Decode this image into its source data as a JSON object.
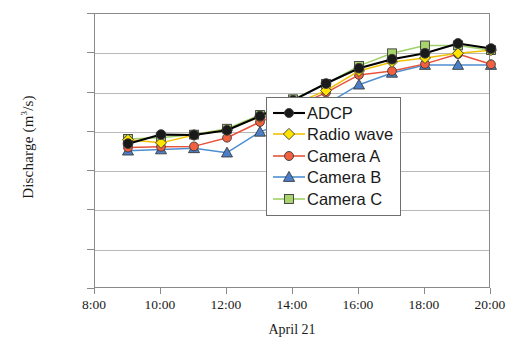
{
  "chart_data": {
    "type": "line",
    "title": "",
    "xlabel": "April 21",
    "ylabel": "Discharge (m3/s)",
    "ylabel_prefix": "Discharge (m",
    "ylabel_exponent": "3",
    "ylabel_suffix": "/s)",
    "ylim": [
      0,
      700
    ],
    "ytick_step": 100,
    "yticks": [
      "0",
      "100",
      "200",
      "300",
      "400",
      "500",
      "600",
      "700"
    ],
    "ytick_values": [
      0,
      100,
      200,
      300,
      400,
      500,
      600,
      700
    ],
    "xlim_hours": [
      8,
      20
    ],
    "xticks": [
      "8:00",
      "10:00",
      "12:00",
      "14:00",
      "16:00",
      "18:00",
      "20:00"
    ],
    "xtick_hours": [
      8,
      10,
      12,
      14,
      16,
      18,
      20
    ],
    "grid": "horizontal",
    "legend_position": "lower-right inside plot",
    "x": [
      9,
      10,
      11,
      12,
      13,
      14,
      15,
      16,
      17,
      18,
      19,
      20
    ],
    "x_labels": [
      "9:00",
      "10:00",
      "11:00",
      "12:00",
      "13:00",
      "14:00",
      "15:00",
      "16:00",
      "17:00",
      "18:00",
      "19:00",
      "20:00"
    ],
    "series": [
      {
        "name": "ADCP",
        "color": "#000000",
        "marker": "circle",
        "marker_color": "#1a1a1a",
        "values": [
          370,
          393,
          392,
          404,
          440,
          480,
          523,
          562,
          585,
          600,
          625,
          612
        ]
      },
      {
        "name": "Radio wave",
        "color": "#f2c200",
        "marker": "diamond",
        "marker_color": "#ffe400",
        "values": [
          380,
          372,
          392,
          405,
          438,
          470,
          505,
          555,
          578,
          588,
          600,
          608
        ]
      },
      {
        "name": "Camera A",
        "color": "#e8533c",
        "marker": "circle",
        "marker_color": "#f2603f",
        "values": [
          360,
          362,
          363,
          385,
          425,
          462,
          500,
          545,
          555,
          573,
          598,
          572
        ]
      },
      {
        "name": "Camera B",
        "color": "#4f8fd0",
        "marker": "triangle",
        "marker_color": "#4a7fc8",
        "values": [
          352,
          355,
          358,
          347,
          400,
          432,
          470,
          520,
          550,
          570,
          570,
          570
        ]
      },
      {
        "name": "Camera C",
        "color": "#9fd06b",
        "marker": "square",
        "marker_color": "#a8d36e",
        "values": [
          382,
          385,
          393,
          408,
          443,
          483,
          522,
          568,
          600,
          620,
          620,
          608
        ]
      }
    ]
  },
  "legend": {
    "items": [
      {
        "label": "ADCP"
      },
      {
        "label": "Radio wave"
      },
      {
        "label": "Camera A"
      },
      {
        "label": "Camera B"
      },
      {
        "label": "Camera C"
      }
    ]
  }
}
